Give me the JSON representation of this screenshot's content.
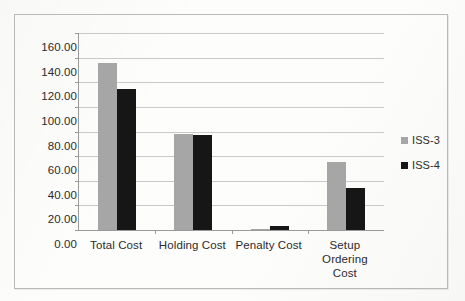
{
  "chart_data": {
    "type": "bar",
    "title": "",
    "subtitle": "",
    "xlabel": "",
    "ylabel": "",
    "categories": [
      "Total Cost",
      "Holding Cost",
      "Penalty Cost",
      "Setup Ordering Cost"
    ],
    "category_lines": [
      [
        "Total Cost"
      ],
      [
        "Holding Cost"
      ],
      [
        "Penalty Cost"
      ],
      [
        "Setup Ordering",
        "Cost"
      ]
    ],
    "series": [
      {
        "name": "ISS-3",
        "color": "#a6a6a6",
        "values": [
          135.5,
          78.0,
          1.0,
          55.0
        ]
      },
      {
        "name": "ISS-4",
        "color": "#161616",
        "values": [
          114.5,
          77.5,
          3.0,
          34.5
        ]
      }
    ],
    "ylim": [
      0,
      160
    ],
    "ytick_values": [
      0,
      20,
      40,
      60,
      80,
      100,
      120,
      140,
      160
    ],
    "ytick_labels": [
      "0.00",
      "20.00",
      "40.00",
      "60.00",
      "80.00",
      "100.00",
      "120.00",
      "140.00",
      "160.00"
    ],
    "grid": true,
    "grid_axis": "y",
    "legend_position": "right",
    "legend_entries": [
      "ISS-3",
      "ISS-4"
    ],
    "annotations": []
  },
  "figure": {
    "border_color": "#b9b9b9",
    "background_color": "#fdfdfc",
    "axis_color": "#9a9a9a",
    "gridline_color": "#c9c9c9",
    "text_color": "#2b2b2b"
  }
}
